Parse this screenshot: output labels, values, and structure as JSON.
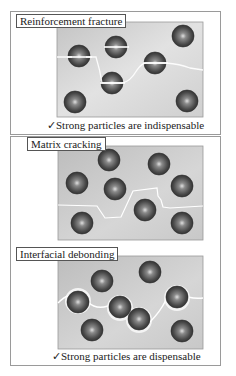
{
  "panels": [
    {
      "title": "Reinforcement fracture",
      "caption_mark": "✓",
      "caption": "Strong particles are indispensable",
      "mechanism": "crack-through-particles"
    },
    {
      "title": "Matrix cracking",
      "mechanism": "crack-through-matrix"
    },
    {
      "title": "Interfacial debonding",
      "caption_mark": "✓",
      "caption": "Strong particles are dispensable",
      "mechanism": "crack-along-interfaces"
    }
  ],
  "colors": {
    "matrix": "#c9c9c9",
    "particle_dark": "#3c3c3c",
    "particle_highlight": "#d8d8d8",
    "crack": "#ffffff",
    "border": "#9a9a9a"
  }
}
